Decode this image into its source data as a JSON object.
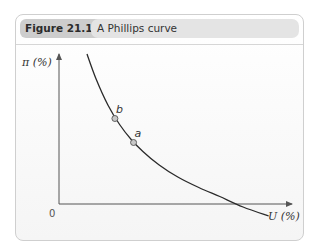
{
  "figure": {
    "number": "Figure 21.11",
    "title": "A Phillips curve"
  },
  "chart_data": {
    "type": "line",
    "title": "A Phillips curve",
    "xlabel": "U (%)",
    "ylabel": "π (%)",
    "origin_label": "0",
    "xlim": [
      0,
      10
    ],
    "ylim": [
      0,
      10
    ],
    "grid": false,
    "legend": "none",
    "series": [
      {
        "name": "Phillips curve",
        "x": [
          1.2,
          1.6,
          2.1,
          2.6,
          3.1,
          3.6,
          4.3,
          5.1,
          6.0,
          6.9,
          7.9,
          9.0
        ],
        "y": [
          10.0,
          8.3,
          6.6,
          5.3,
          4.3,
          3.5,
          2.6,
          1.8,
          1.1,
          0.5,
          -0.2,
          -0.8
        ]
      }
    ],
    "points": [
      {
        "label": "b",
        "x": 2.4,
        "y": 5.7
      },
      {
        "label": "a",
        "x": 3.2,
        "y": 4.1
      }
    ],
    "colors": {
      "curve": "#2a2a2a",
      "axis": "#555555",
      "point_fill": "#c8c8c8",
      "point_stroke": "#555555"
    }
  }
}
